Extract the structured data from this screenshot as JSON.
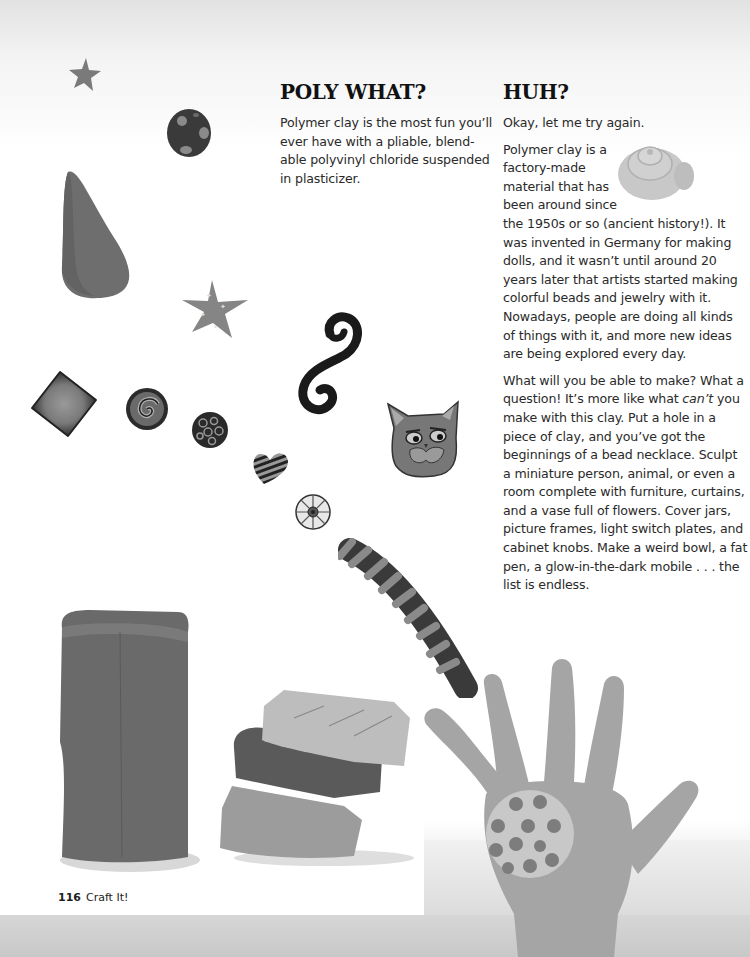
{
  "left_column": {
    "heading": "POLY WHAT?",
    "paragraph": "Polymer clay is the most fun you'll ever have with a pliable, blend-able polyvinyl chloride suspended in plasticizer.",
    "lines": [
      "Polymer clay is the most fun you’ll",
      "ever have with a pliable, blend-",
      "able polyvinyl chloride suspended",
      "in plasticizer."
    ]
  },
  "right_column": {
    "heading": "HUH?",
    "intro": "Okay, let me try again.",
    "paragraph_1_wrapped_lines": [
      "Polymer clay is a",
      "factory-made",
      "material that has",
      "been around since"
    ],
    "paragraph_1_rest": "the 1950s or so (ancient history!). It was invented in Germany for making dolls, and it wasn’t until around 20 years later that artists started making colorful beads and jewelry with it. Nowadays, people are doing all kinds of things with it, and more new ideas are being explored every day.",
    "paragraph_2_start": "What will you be able to make? What a question! It’s more like what ",
    "paragraph_2_emphasis": "can’t",
    "paragraph_2_end": " you make with this clay. Put a hole in a piece of clay, and you’ve got the beginnings of a bead necklace. Sculpt a miniature person, animal, or even a room complete with furniture, curtains, and a vase full of flowers. Cover jars, picture frames, light switch plates, and cabinet knobs. Make a weird bowl, a fat pen, a glow-in-the-dark mobile . . . the list is endless."
  },
  "footer": {
    "page_number": "116",
    "section_title": "Craft It!"
  },
  "illustrations": [
    "small-star",
    "polka-dot-bead",
    "teardrop-cone",
    "starry-star",
    "spiral-s-swirl",
    "square-blended-bead",
    "spiral-cane-bead",
    "millefiori-bead",
    "striped-heart",
    "cat-face-pin",
    "flower-cane-slice",
    "twisted-rope-cane",
    "coiled-snail-bead",
    "tall-clay-block",
    "stacked-clay-blocks",
    "hand-with-polka-dot-disc"
  ],
  "colors": {
    "text": "#2a2a2a",
    "heading": "#111111",
    "background_top": "#e2e2e2",
    "page": "#ffffff"
  }
}
